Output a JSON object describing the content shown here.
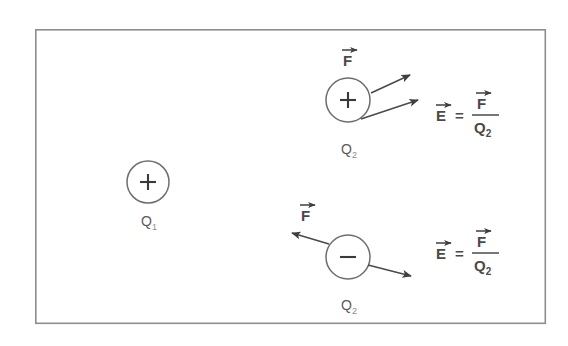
{
  "figure": {
    "kind": "physics-diagram",
    "frame": {
      "x": 35,
      "y": 29,
      "width": 511,
      "height": 295,
      "border_color": "#8d8d8d"
    },
    "background_color": "#ffffff",
    "ink_color": "#4a4a4a"
  },
  "charges": [
    {
      "id": "source-charge",
      "label": "Q",
      "subscript": "1",
      "sign": "+",
      "cx": 148,
      "cy": 182,
      "r": 21,
      "label_x": 142,
      "label_y": 224
    },
    {
      "id": "test-charge-positive",
      "label": "Q",
      "subscript": "2",
      "sign": "+",
      "cx": 348,
      "cy": 100,
      "r": 22,
      "label_x": 342,
      "label_y": 152
    },
    {
      "id": "test-charge-negative",
      "label": "Q",
      "subscript": "2",
      "sign": "−",
      "cx": 348,
      "cy": 257,
      "r": 22,
      "label_x": 342,
      "label_y": 308
    }
  ],
  "vectors": [
    {
      "id": "force-vector-upper",
      "label": "F",
      "x1": 371,
      "y1": 93,
      "x2": 414,
      "y2": 74,
      "label_x": 345,
      "label_y": 62
    },
    {
      "id": "field-vector-upper",
      "label": "E",
      "x1": 361,
      "y1": 119,
      "x2": 422,
      "y2": 99,
      "label_x": 0,
      "label_y": 0
    },
    {
      "id": "force-vector-lower",
      "label": "F",
      "x1": 329,
      "y1": 244,
      "x2": 289,
      "y2": 232,
      "label_x": 302,
      "label_y": 217
    },
    {
      "id": "field-vector-lower",
      "label": "E",
      "x1": 368,
      "y1": 265,
      "x2": 414,
      "y2": 277,
      "label_x": 0,
      "label_y": 0
    }
  ],
  "equations": [
    {
      "id": "field-equation-upper",
      "lhs": "E",
      "operator": "=",
      "numerator": "F",
      "denominator": "Q",
      "denominator_subscript": "2",
      "x": 437,
      "y": 124,
      "text": "E = F / Q2"
    },
    {
      "id": "field-equation-lower",
      "lhs": "E",
      "operator": "=",
      "numerator": "F",
      "denominator": "Q",
      "denominator_subscript": "2",
      "x": 437,
      "y": 262,
      "text": "E = F / Q2"
    }
  ]
}
